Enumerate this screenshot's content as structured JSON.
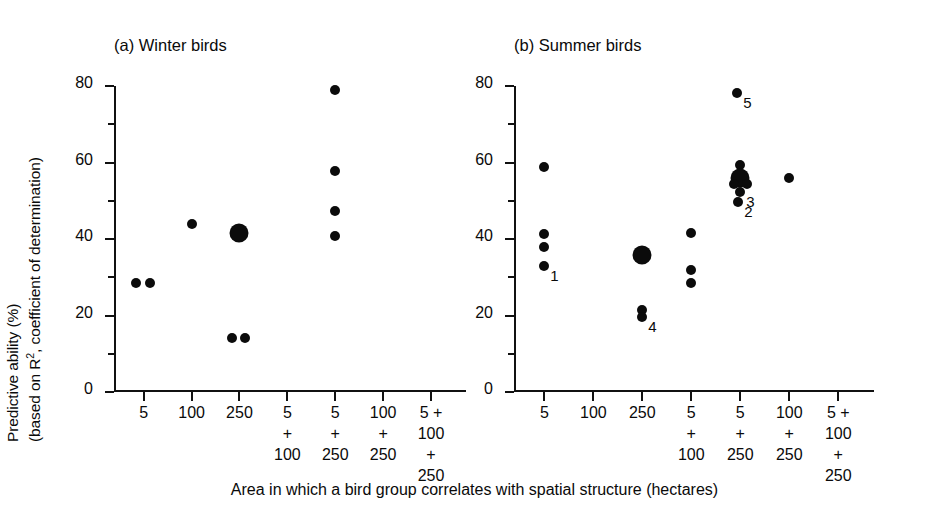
{
  "figure": {
    "y_axis_title_line1": "Predictive ability (%)",
    "y_axis_title_line2_pre": "(based on R",
    "y_axis_title_line2_sup": "2",
    "y_axis_title_line2_post": ", coefficient of determination)",
    "x_axis_caption": "Area in which a bird group correlates with spatial structure (hectares)"
  },
  "chart_data": [
    {
      "type": "scatter",
      "title": "(a) Winter birds",
      "xlabel": "Area in which a bird group correlates with spatial structure (hectares)",
      "ylabel": "Predictive ability (%) (based on R2, coefficient of determination)",
      "ylim": [
        0,
        80
      ],
      "yticks": [
        0,
        20,
        40,
        60,
        80
      ],
      "yticks_minor": [
        10,
        30,
        50,
        70
      ],
      "grid": false,
      "legend": "none",
      "categories": [
        "5",
        "100",
        "250",
        "5\n+\n100",
        "5\n+\n250",
        "100\n+\n250",
        "5 +\n100\n+\n250"
      ],
      "category_labels": [
        [
          "5"
        ],
        [
          "100"
        ],
        [
          "250"
        ],
        [
          "5",
          "+",
          "100"
        ],
        [
          "5",
          "+",
          "250"
        ],
        [
          "100",
          "+",
          "250"
        ],
        [
          "5 +",
          "100",
          "+",
          "250"
        ]
      ],
      "points": [
        {
          "category": "5",
          "value": 28.5,
          "offset": -0.17,
          "size": "small"
        },
        {
          "category": "5",
          "value": 28.6,
          "offset": 0.13,
          "size": "small"
        },
        {
          "category": "100",
          "value": 44.0,
          "offset": 0.0,
          "size": "small"
        },
        {
          "category": "250",
          "value": 41.5,
          "offset": 0.0,
          "size": "large"
        },
        {
          "category": "250",
          "value": 14.0,
          "offset": -0.16,
          "size": "small"
        },
        {
          "category": "250",
          "value": 14.2,
          "offset": 0.12,
          "size": "small"
        },
        {
          "category": "5+250",
          "value": 79.0,
          "offset": 0.0,
          "size": "small"
        },
        {
          "category": "5+250",
          "value": 57.8,
          "offset": 0.0,
          "size": "small"
        },
        {
          "category": "5+250",
          "value": 47.3,
          "offset": 0.0,
          "size": "small"
        },
        {
          "category": "5+250",
          "value": 40.8,
          "offset": 0.0,
          "size": "small"
        }
      ]
    },
    {
      "type": "scatter",
      "title": "(b) Summer birds",
      "xlabel": "Area in which a bird group correlates with spatial structure (hectares)",
      "ylabel": "Predictive ability (%) (based on R2, coefficient of determination)",
      "ylim": [
        0,
        80
      ],
      "yticks": [
        0,
        20,
        40,
        60,
        80
      ],
      "yticks_minor": [
        10,
        30,
        50,
        70
      ],
      "grid": false,
      "legend": "none",
      "categories": [
        "5",
        "100",
        "250",
        "5\n+\n100",
        "5\n+\n250",
        "100\n+\n250",
        "5 +\n100\n+\n250"
      ],
      "category_labels": [
        [
          "5"
        ],
        [
          "100"
        ],
        [
          "250"
        ],
        [
          "5",
          "+",
          "100"
        ],
        [
          "5",
          "+",
          "250"
        ],
        [
          "100",
          "+",
          "250"
        ],
        [
          "5 +",
          "100",
          "+",
          "250"
        ]
      ],
      "points": [
        {
          "category": "5",
          "value": 58.8,
          "offset": 0.0,
          "size": "small"
        },
        {
          "category": "5",
          "value": 41.3,
          "offset": 0.0,
          "size": "small"
        },
        {
          "category": "5",
          "value": 37.8,
          "offset": 0.0,
          "size": "small"
        },
        {
          "category": "5",
          "value": 33.0,
          "offset": 0.0,
          "size": "small",
          "label": "1"
        },
        {
          "category": "250",
          "value": 35.8,
          "offset": 0.0,
          "size": "large"
        },
        {
          "category": "250",
          "value": 21.5,
          "offset": 0.0,
          "size": "small"
        },
        {
          "category": "250",
          "value": 19.6,
          "offset": 0.0,
          "size": "small",
          "label": "4"
        },
        {
          "category": "5+100",
          "value": 41.5,
          "offset": 0.0,
          "size": "small"
        },
        {
          "category": "5+100",
          "value": 32.0,
          "offset": 0.0,
          "size": "small"
        },
        {
          "category": "5+100",
          "value": 28.5,
          "offset": 0.0,
          "size": "small"
        },
        {
          "category": "5+250",
          "value": 78.3,
          "offset": -0.06,
          "size": "small",
          "label": "5"
        },
        {
          "category": "5+250",
          "value": 59.3,
          "offset": 0.0,
          "size": "small"
        },
        {
          "category": "5+250",
          "value": 56.0,
          "offset": 0.0,
          "size": "large"
        },
        {
          "category": "5+250",
          "value": 54.5,
          "offset": -0.13,
          "size": "small"
        },
        {
          "category": "5+250",
          "value": 54.5,
          "offset": 0.13,
          "size": "small"
        },
        {
          "category": "5+250",
          "value": 52.2,
          "offset": 0.0,
          "size": "small",
          "label": "3"
        },
        {
          "category": "5+250",
          "value": 49.8,
          "offset": -0.04,
          "size": "small",
          "label": "2"
        },
        {
          "category": "100+250",
          "value": 56.0,
          "offset": 0.0,
          "size": "small"
        }
      ]
    }
  ]
}
